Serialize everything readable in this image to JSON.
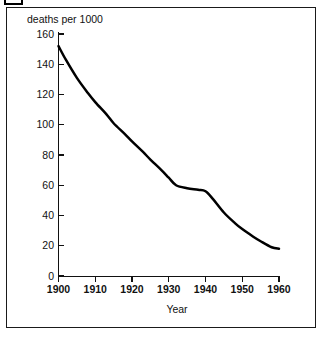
{
  "figure": {
    "corner_tab_name": "crop-marker"
  },
  "chart_data": {
    "type": "line",
    "title": "",
    "subtitle": "",
    "xlabel": "Year",
    "ylabel": "deaths per 1000",
    "ylabel_position": "above-axis",
    "grid": false,
    "legend": "none",
    "xlim": [
      1900,
      1960
    ],
    "ylim": [
      0,
      160
    ],
    "xticks": [
      1900,
      1910,
      1920,
      1930,
      1940,
      1950,
      1960
    ],
    "xtick_labels": [
      "1900",
      "1910",
      "1920",
      "1930",
      "1940",
      "1950",
      "1960"
    ],
    "yticks": [
      0,
      20,
      40,
      60,
      80,
      100,
      120,
      140,
      160
    ],
    "ytick_labels": [
      "0",
      "20",
      "40",
      "60",
      "80",
      "100",
      "120",
      "140",
      "160"
    ],
    "series": [
      {
        "name": "deaths per 1000",
        "color": "#000000",
        "x": [
          1900,
          1902,
          1905,
          1908,
          1910,
          1913,
          1915,
          1918,
          1920,
          1923,
          1925,
          1928,
          1930,
          1932,
          1935,
          1938,
          1940,
          1942,
          1945,
          1948,
          1950,
          1953,
          1955,
          1958,
          1960
        ],
        "values": [
          152,
          143,
          131,
          121,
          115,
          107,
          101,
          94,
          89,
          82,
          77,
          70,
          65,
          60,
          58,
          57,
          56,
          51,
          42,
          35,
          31,
          26,
          23,
          19,
          18
        ]
      }
    ],
    "annotations": []
  }
}
